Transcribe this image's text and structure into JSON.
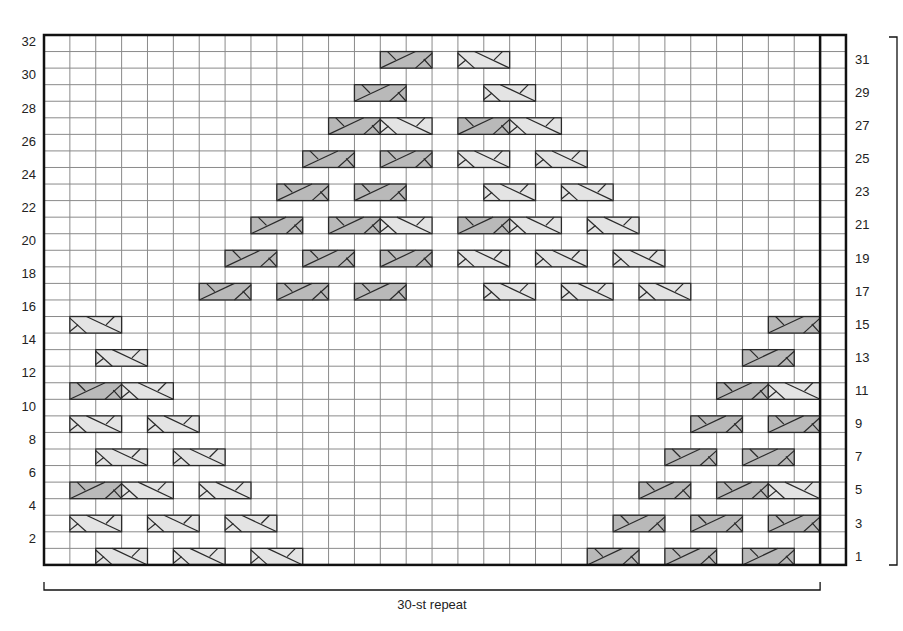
{
  "chart": {
    "columns": 31,
    "rows": 32,
    "repeat_columns": 30,
    "repeat_label": "30-st repeat",
    "colors": {
      "grid_line": "#8a8a8a",
      "border": "#111111",
      "dark_cable_fill": "#b9b9b9",
      "light_cable_fill": "#e4e4e4",
      "cable_stroke": "#2a2a2a"
    },
    "left_row_labels": [
      "2",
      "4",
      "6",
      "8",
      "10",
      "12",
      "14",
      "16",
      "18",
      "20",
      "22",
      "24",
      "26",
      "28",
      "30",
      "32"
    ],
    "right_row_labels": [
      "1",
      "3",
      "5",
      "7",
      "9",
      "11",
      "13",
      "15",
      "17",
      "19",
      "21",
      "23",
      "25",
      "27",
      "29",
      "31"
    ],
    "legend": {
      "dark": "right-cross cable (2 sts)",
      "light": "left-cross cable (2 sts)"
    },
    "cables": [
      {
        "row": 1,
        "col": 2,
        "type": "light"
      },
      {
        "row": 1,
        "col": 5,
        "type": "light"
      },
      {
        "row": 1,
        "col": 8,
        "type": "light"
      },
      {
        "row": 1,
        "col": 21,
        "type": "dark"
      },
      {
        "row": 1,
        "col": 24,
        "type": "dark"
      },
      {
        "row": 1,
        "col": 27,
        "type": "dark"
      },
      {
        "row": 3,
        "col": 1,
        "type": "light"
      },
      {
        "row": 3,
        "col": 4,
        "type": "light"
      },
      {
        "row": 3,
        "col": 7,
        "type": "light"
      },
      {
        "row": 3,
        "col": 22,
        "type": "dark"
      },
      {
        "row": 3,
        "col": 25,
        "type": "dark"
      },
      {
        "row": 3,
        "col": 28,
        "type": "dark"
      },
      {
        "row": 5,
        "col": 1,
        "type": "dark"
      },
      {
        "row": 5,
        "col": 3,
        "type": "light"
      },
      {
        "row": 5,
        "col": 6,
        "type": "light"
      },
      {
        "row": 5,
        "col": 23,
        "type": "dark"
      },
      {
        "row": 5,
        "col": 26,
        "type": "dark"
      },
      {
        "row": 5,
        "col": 28,
        "type": "light"
      },
      {
        "row": 7,
        "col": 2,
        "type": "light"
      },
      {
        "row": 7,
        "col": 5,
        "type": "light"
      },
      {
        "row": 7,
        "col": 24,
        "type": "dark"
      },
      {
        "row": 7,
        "col": 27,
        "type": "dark"
      },
      {
        "row": 9,
        "col": 1,
        "type": "light"
      },
      {
        "row": 9,
        "col": 4,
        "type": "light"
      },
      {
        "row": 9,
        "col": 25,
        "type": "dark"
      },
      {
        "row": 9,
        "col": 28,
        "type": "dark"
      },
      {
        "row": 11,
        "col": 1,
        "type": "dark"
      },
      {
        "row": 11,
        "col": 3,
        "type": "light"
      },
      {
        "row": 11,
        "col": 26,
        "type": "dark"
      },
      {
        "row": 11,
        "col": 28,
        "type": "light"
      },
      {
        "row": 13,
        "col": 2,
        "type": "light"
      },
      {
        "row": 13,
        "col": 27,
        "type": "dark"
      },
      {
        "row": 15,
        "col": 1,
        "type": "light"
      },
      {
        "row": 15,
        "col": 28,
        "type": "dark"
      },
      {
        "row": 17,
        "col": 6,
        "type": "dark"
      },
      {
        "row": 17,
        "col": 9,
        "type": "dark"
      },
      {
        "row": 17,
        "col": 12,
        "type": "dark"
      },
      {
        "row": 17,
        "col": 17,
        "type": "light"
      },
      {
        "row": 17,
        "col": 20,
        "type": "light"
      },
      {
        "row": 17,
        "col": 23,
        "type": "light"
      },
      {
        "row": 19,
        "col": 7,
        "type": "dark"
      },
      {
        "row": 19,
        "col": 10,
        "type": "dark"
      },
      {
        "row": 19,
        "col": 13,
        "type": "dark"
      },
      {
        "row": 19,
        "col": 16,
        "type": "light"
      },
      {
        "row": 19,
        "col": 19,
        "type": "light"
      },
      {
        "row": 19,
        "col": 22,
        "type": "light"
      },
      {
        "row": 21,
        "col": 8,
        "type": "dark"
      },
      {
        "row": 21,
        "col": 11,
        "type": "dark"
      },
      {
        "row": 21,
        "col": 13,
        "type": "light"
      },
      {
        "row": 21,
        "col": 16,
        "type": "dark"
      },
      {
        "row": 21,
        "col": 18,
        "type": "light"
      },
      {
        "row": 21,
        "col": 21,
        "type": "light"
      },
      {
        "row": 23,
        "col": 9,
        "type": "dark"
      },
      {
        "row": 23,
        "col": 12,
        "type": "dark"
      },
      {
        "row": 23,
        "col": 17,
        "type": "light"
      },
      {
        "row": 23,
        "col": 20,
        "type": "light"
      },
      {
        "row": 25,
        "col": 10,
        "type": "dark"
      },
      {
        "row": 25,
        "col": 13,
        "type": "dark"
      },
      {
        "row": 25,
        "col": 16,
        "type": "light"
      },
      {
        "row": 25,
        "col": 19,
        "type": "light"
      },
      {
        "row": 27,
        "col": 11,
        "type": "dark"
      },
      {
        "row": 27,
        "col": 13,
        "type": "light"
      },
      {
        "row": 27,
        "col": 16,
        "type": "dark"
      },
      {
        "row": 27,
        "col": 18,
        "type": "light"
      },
      {
        "row": 29,
        "col": 12,
        "type": "dark"
      },
      {
        "row": 29,
        "col": 17,
        "type": "light"
      },
      {
        "row": 31,
        "col": 13,
        "type": "dark"
      },
      {
        "row": 31,
        "col": 16,
        "type": "light"
      }
    ]
  }
}
